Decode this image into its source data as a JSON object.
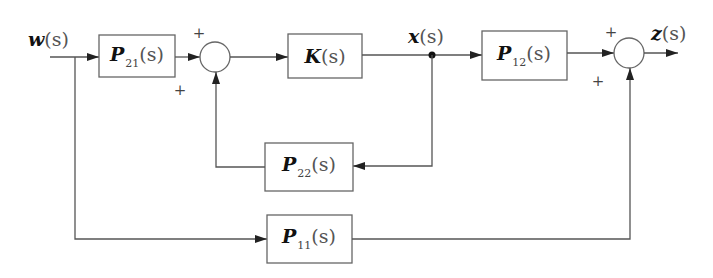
{
  "diagram": {
    "type": "block-diagram",
    "colors": {
      "line": "#555555",
      "box_border": "#666666",
      "text": "#222222",
      "background": "#ffffff"
    },
    "signals": {
      "input": {
        "symbol": "w",
        "arg": "(s)"
      },
      "internal": {
        "symbol": "x",
        "arg": "(s)"
      },
      "output": {
        "symbol": "z",
        "arg": "(s)"
      }
    },
    "blocks": {
      "p21": {
        "symbol": "P",
        "sub": "21",
        "arg": "(s)"
      },
      "k": {
        "symbol": "K",
        "sub": "",
        "arg": "(s)"
      },
      "p12": {
        "symbol": "P",
        "sub": "12",
        "arg": "(s)"
      },
      "p22": {
        "symbol": "P",
        "sub": "22",
        "arg": "(s)"
      },
      "p11": {
        "symbol": "P",
        "sub": "11",
        "arg": "(s)"
      }
    },
    "summing_junctions": {
      "left": {
        "top_sign": "+",
        "bottom_sign": "+"
      },
      "right": {
        "top_sign": "+",
        "bottom_sign": "+"
      }
    },
    "connections": [
      "w(s) -> P21(s)",
      "P21(s) -> left sum (+)",
      "left sum -> K(s)",
      "K(s) -> x(s)",
      "x(s) -> P12(s)",
      "x(s) -> P22(s)",
      "P22(s) -> left sum (+)",
      "P12(s) -> right sum (+)",
      "w(s) -> P11(s)",
      "P11(s) -> right sum (+)",
      "right sum -> z(s)"
    ]
  }
}
